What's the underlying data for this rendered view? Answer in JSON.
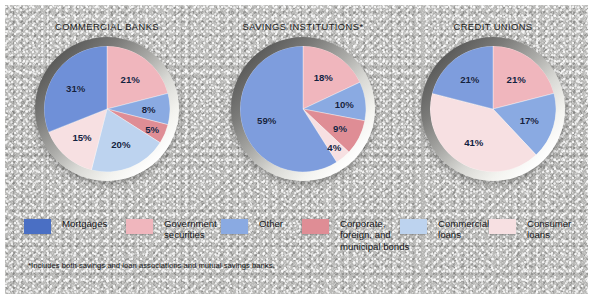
{
  "figure": {
    "background_color": "#b9b9b7",
    "frame_color": "#ffffff"
  },
  "palette": {
    "mortgages": "#4a6fc4",
    "mortgages_light": "#7e9ddd",
    "government_securities": "#f0b6bd",
    "other": "#8aaae2",
    "corporate_foreign_municipal_bonds": "#df8d95",
    "commercial_loans": "#bdd3ef",
    "consumer_loans": "#f7e0e2",
    "label_text": "#12213f"
  },
  "legend": {
    "items": [
      {
        "label": "Mortgages",
        "color": "#4a6fc4",
        "key": "mortgages"
      },
      {
        "label": "Government\nsecurities",
        "color": "#f0b6bd",
        "key": "government-securities"
      },
      {
        "label": "Other",
        "color": "#8aaae2",
        "key": "other"
      },
      {
        "label": "Corporate,\nforeign, and\nmunicipal bonds",
        "color": "#df8d95",
        "key": "corporate-foreign-municipal-bonds"
      },
      {
        "label": "Commercial\nloans",
        "color": "#bdd3ef",
        "key": "commercial-loans"
      },
      {
        "label": "Consumer\nloans",
        "color": "#f7e0e2",
        "key": "consumer-loans"
      }
    ]
  },
  "footnote": "*Includes both savings and loan associations and mutual savings banks.",
  "chart_data": [
    {
      "type": "pie",
      "title": "COMMERCIAL BANKS",
      "labels": [
        "Government securities",
        "Other",
        "Corporate, foreign, and municipal bonds",
        "Commercial loans",
        "Consumer loans",
        "Mortgages"
      ],
      "values": [
        21,
        8,
        5,
        20,
        15,
        31
      ],
      "value_labels": [
        "21%",
        "8%",
        "5%",
        "20%",
        "15%",
        "31%"
      ],
      "colors": [
        "#f0b6bd",
        "#8aaae2",
        "#df8d95",
        "#bdd3ef",
        "#f7e0e2",
        "#6f90d8"
      ],
      "start_angle_deg": 0,
      "direction": "clockwise",
      "total": 100,
      "units": "percent"
    },
    {
      "type": "pie",
      "title": "SAVINGS INSTITUTIONS*",
      "labels": [
        "Government securities",
        "Other",
        "Corporate, foreign, and municipal bonds",
        "Consumer loans",
        "Mortgages"
      ],
      "values": [
        18,
        10,
        9,
        4,
        59
      ],
      "value_labels": [
        "18%",
        "10%",
        "9%",
        "4%",
        "59%"
      ],
      "colors": [
        "#f0b6bd",
        "#8aaae2",
        "#df8d95",
        "#f7e0e2",
        "#7e9ddd"
      ],
      "start_angle_deg": 0,
      "direction": "clockwise",
      "total": 100,
      "units": "percent"
    },
    {
      "type": "pie",
      "title": "CREDIT UNIONS",
      "labels": [
        "Government securities",
        "Other",
        "Consumer loans",
        "Mortgages"
      ],
      "values": [
        21,
        17,
        41,
        21
      ],
      "value_labels": [
        "21%",
        "17%",
        "41%",
        "21%"
      ],
      "colors": [
        "#f0b6bd",
        "#8aaae2",
        "#f7e0e2",
        "#7e9ddd"
      ],
      "start_angle_deg": 0,
      "direction": "clockwise",
      "total": 100,
      "units": "percent"
    }
  ]
}
